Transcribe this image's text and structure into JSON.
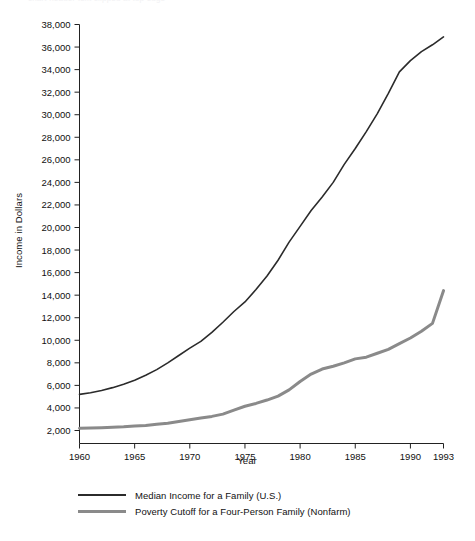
{
  "top_remnant_text": "chart header text clipped at top edge",
  "chart_data": {
    "type": "line",
    "title": "",
    "xlabel": "Year",
    "ylabel": "Income in Dollars",
    "xlim": [
      1960,
      1993
    ],
    "ylim": [
      0,
      38000
    ],
    "grid": false,
    "legend_position": "below",
    "x_ticks": [
      "1960",
      "1965",
      "1970",
      "1975",
      "1980",
      "1985",
      "1990",
      "1993"
    ],
    "x_tick_values": [
      1960,
      1965,
      1970,
      1975,
      1980,
      1985,
      1990,
      1993
    ],
    "y_ticks": [
      "2,000",
      "4,000",
      "6,000",
      "8,000",
      "10,000",
      "12,000",
      "14,000",
      "16,000",
      "18,000",
      "20,000",
      "22,000",
      "24,000",
      "26,000",
      "28,000",
      "30,000",
      "32,000",
      "34,000",
      "36,000",
      "38,000"
    ],
    "y_tick_values": [
      2000,
      4000,
      6000,
      8000,
      10000,
      12000,
      14000,
      16000,
      18000,
      20000,
      22000,
      24000,
      26000,
      28000,
      30000,
      32000,
      34000,
      36000,
      38000
    ],
    "x": [
      1960,
      1961,
      1962,
      1963,
      1964,
      1965,
      1966,
      1967,
      1968,
      1969,
      1970,
      1971,
      1972,
      1973,
      1974,
      1975,
      1976,
      1977,
      1978,
      1979,
      1980,
      1981,
      1982,
      1983,
      1984,
      1985,
      1986,
      1987,
      1988,
      1989,
      1990,
      1991,
      1992,
      1993
    ],
    "series": [
      {
        "name": "Median Income for a Family (U.S.)",
        "color": "#2b2b2b",
        "width": 1.6,
        "values": [
          5200,
          5350,
          5550,
          5800,
          6100,
          6450,
          6900,
          7400,
          8000,
          8650,
          9300,
          9900,
          10700,
          11600,
          12550,
          13400,
          14500,
          15700,
          17100,
          18700,
          20100,
          21500,
          22700,
          24000,
          25600,
          27000,
          28500,
          30100,
          31900,
          33800,
          34800,
          35600,
          36200,
          36900
        ]
      },
      {
        "name": "Poverty Cutoff for a Four-Person Family (Nonfarm)",
        "color": "#8a8a8a",
        "width": 3.0,
        "values": [
          2200,
          2220,
          2250,
          2290,
          2330,
          2400,
          2450,
          2550,
          2650,
          2800,
          2950,
          3100,
          3250,
          3450,
          3800,
          4150,
          4400,
          4700,
          5050,
          5600,
          6350,
          7000,
          7450,
          7700,
          8000,
          8350,
          8500,
          8850,
          9200,
          9700,
          10200,
          10800,
          11500,
          14400
        ]
      }
    ]
  }
}
